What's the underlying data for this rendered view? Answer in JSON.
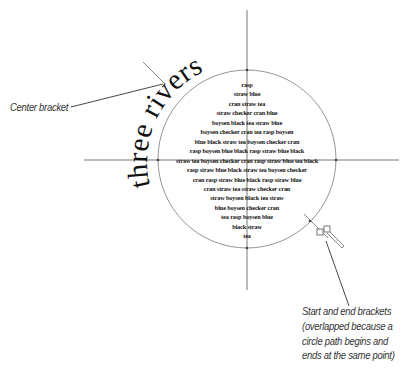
{
  "diagram": {
    "path_text": "three rivers",
    "area_text_lines": [
      "rasp",
      "straw blue",
      "cran straw tea",
      "straw checker cran  blue",
      "boysen black tea  straw blue",
      "boysen checker cran tea rasp boysen",
      "blue black straw tea boysen checker cran",
      "rasp boysen blue black rasp straw blue black",
      "straw tea boysen checker cran rasp straw blue tea black",
      "rasp straw blue black straw tea boysen checker",
      "cran rasp straw blue black rasp straw blue",
      "cran straw tea straw checker cran",
      "straw boysen black tea  straw",
      "blue boysen checker cran",
      "tea rasp boysen blue",
      "black straw",
      "tea"
    ],
    "callouts": {
      "center_bracket": "Center bracket",
      "start_end_brackets": [
        "Start and end brackets",
        "(overlapped because a",
        "circle path begins and",
        "ends at the same point)"
      ]
    },
    "colors": {
      "circle_stroke": "#777777",
      "guide_lines": "#555555",
      "text": "#111111",
      "callout_text": "#333333"
    }
  }
}
